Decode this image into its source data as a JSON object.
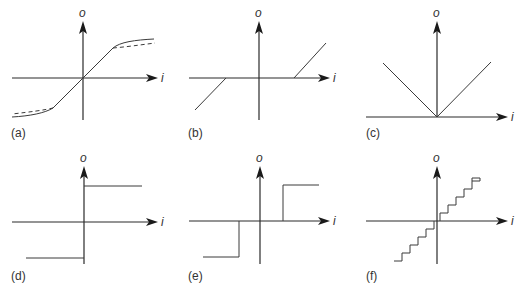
{
  "figure": {
    "axis_labels": {
      "output": "o",
      "input": "i"
    },
    "panels": [
      {
        "id": "a",
        "label": "(a)",
        "description": "saturation / soft-limiting nonlinearity (solid curve with dashed alternative)"
      },
      {
        "id": "b",
        "label": "(b)",
        "description": "dead-zone nonlinearity"
      },
      {
        "id": "c",
        "label": "(c)",
        "description": "absolute value (full-wave rectifier)"
      },
      {
        "id": "d",
        "label": "(d)",
        "description": "ideal relay / sign function"
      },
      {
        "id": "e",
        "label": "(e)",
        "description": "relay with dead zone"
      },
      {
        "id": "f",
        "label": "(f)",
        "description": "quantizer (staircase)"
      }
    ]
  },
  "colors": {
    "line": "#3a3a3a",
    "axis": "#2a2a2a",
    "background": "#ffffff"
  }
}
